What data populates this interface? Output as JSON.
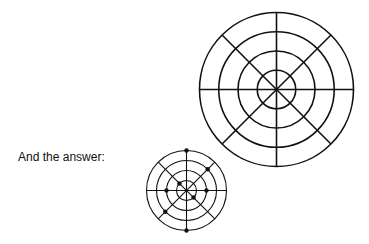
{
  "caption": "And the answer:",
  "puzzle_grid": {
    "rings": 4,
    "spokes": 8
  },
  "answer_grid": {
    "rings": 4,
    "spokes": 8,
    "marked_points": [
      {
        "ring": 4,
        "direction": "N"
      },
      {
        "ring": 3,
        "direction": "NE"
      },
      {
        "ring": 1,
        "direction": "NW"
      },
      {
        "ring": 2,
        "direction": "W"
      },
      {
        "ring": 2,
        "direction": "E"
      },
      {
        "ring": 1,
        "direction": "SE"
      },
      {
        "ring": 3,
        "direction": "SW"
      },
      {
        "ring": 4,
        "direction": "S"
      }
    ]
  },
  "colors": {
    "stroke": "#111111",
    "dot": "#111111"
  }
}
